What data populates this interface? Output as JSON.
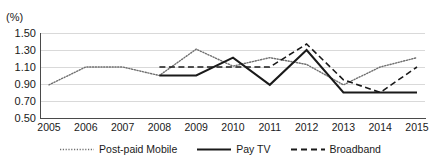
{
  "header": {
    "faint_top_text": "",
    "unit_label": "(%)"
  },
  "chart_data": {
    "type": "line",
    "title": "",
    "xlabel": "",
    "ylabel": "(%)",
    "ylim": [
      0.5,
      1.5
    ],
    "yticks": [
      "1.50",
      "1.30",
      "1.10",
      "0.90",
      "0.70",
      "0.50"
    ],
    "ytick_values": [
      1.5,
      1.3,
      1.1,
      0.9,
      0.7,
      0.5
    ],
    "grid": true,
    "legend_position": "bottom",
    "categories": [
      "2005",
      "2006",
      "2007",
      "2008",
      "2009",
      "2010",
      "2011",
      "2012",
      "2013",
      "2014",
      "2015"
    ],
    "x": [
      2005,
      2006,
      2007,
      2008,
      2009,
      2010,
      2011,
      2012,
      2013,
      2014,
      2015
    ],
    "series": [
      {
        "name": "Post-paid Mobile",
        "style": "dotted",
        "color": "#6f6f6f",
        "values": [
          0.89,
          1.1,
          1.1,
          1.0,
          1.31,
          1.11,
          1.21,
          1.13,
          0.89,
          1.1,
          1.21
        ]
      },
      {
        "name": "Pay TV",
        "style": "solid",
        "color": "#1a1a1a",
        "values": [
          null,
          null,
          null,
          1.0,
          1.0,
          1.21,
          0.89,
          1.3,
          0.8,
          0.8,
          0.8
        ]
      },
      {
        "name": "Broadband",
        "style": "dashed",
        "color": "#1a1a1a",
        "values": [
          null,
          null,
          null,
          1.1,
          1.1,
          1.1,
          1.1,
          1.37,
          0.95,
          0.8,
          1.1
        ]
      }
    ]
  },
  "legend": {
    "items": [
      {
        "label": "Post-paid Mobile",
        "swatch": "dotted-line-swatch"
      },
      {
        "label": "Pay TV",
        "swatch": "solid-line-swatch"
      },
      {
        "label": "Broadband",
        "swatch": "dashed-line-swatch"
      }
    ]
  }
}
